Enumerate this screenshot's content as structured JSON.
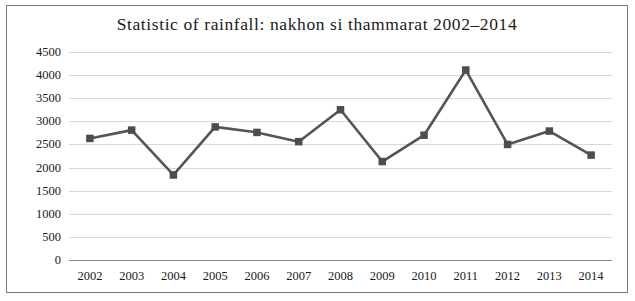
{
  "chart_data": {
    "type": "line",
    "title": "Statistic of rainfall:  nakhon si thammarat  2002–2014",
    "xlabel": "",
    "ylabel": "",
    "categories": [
      "2002",
      "2003",
      "2004",
      "2005",
      "2006",
      "2007",
      "2008",
      "2009",
      "2010",
      "2011",
      "2012",
      "2013",
      "2014"
    ],
    "values": [
      2630,
      2810,
      1840,
      2880,
      2760,
      2560,
      3250,
      2130,
      2700,
      4110,
      2500,
      2790,
      2270
    ],
    "series": [
      {
        "name": "rainfall",
        "values": [
          2630,
          2810,
          1840,
          2880,
          2760,
          2560,
          3250,
          2130,
          2700,
          4110,
          2500,
          2790,
          2270
        ]
      }
    ],
    "ylim": [
      0,
      4500
    ],
    "ytick_labels": [
      "0",
      "500",
      "1000",
      "1500",
      "2000",
      "2500",
      "3000",
      "3500",
      "4000",
      "4500"
    ],
    "ytick_values": [
      0,
      500,
      1000,
      1500,
      2000,
      2500,
      3000,
      3500,
      4000,
      4500
    ],
    "grid": true,
    "legend": "none",
    "line_color": "#555555",
    "marker_color": "#4d4d4d",
    "grid_color": "#d8d8d8",
    "border_color": "#7a7a7a"
  }
}
